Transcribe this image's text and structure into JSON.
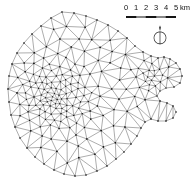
{
  "figure": {
    "background_color": "#ffffff",
    "line_color": "#3a3a3a",
    "node_color": "#111111",
    "width": 194,
    "height": 184
  },
  "map": {
    "type": "triangular-finite-element-mesh",
    "description": "Unstructured triangular mesh over an irregular island-shaped domain with locally refined (dense) zones",
    "domain_extent": {
      "x_min": 8,
      "x_max": 182,
      "y_min": 12,
      "y_max": 176
    }
  },
  "legend": {
    "scale_bar": {
      "unit": "km",
      "tick_labels": [
        "0",
        "1",
        "2",
        "3",
        "4",
        "5"
      ],
      "unit_label": "km",
      "min_value": 0,
      "max_value": 5,
      "bar_fill_colors": [
        "#1a1a1a",
        "#ffffff"
      ]
    },
    "north_arrow": {
      "label": "",
      "symbol": "north-arrow-circle"
    }
  },
  "chart_data": {
    "type": "scatter",
    "title": "",
    "xlabel": "",
    "ylabel": "",
    "grid": false,
    "legend_position": "top-right",
    "scale_km": {
      "ticks": [
        0,
        1,
        2,
        3,
        4,
        5
      ],
      "unit": "km"
    },
    "boundary_polygon": [
      [
        62,
        12
      ],
      [
        74,
        13
      ],
      [
        86,
        16
      ],
      [
        97,
        20
      ],
      [
        108,
        25
      ],
      [
        118,
        31
      ],
      [
        127,
        38
      ],
      [
        135,
        46
      ],
      [
        143,
        52
      ],
      [
        151,
        56
      ],
      [
        158,
        58
      ],
      [
        164,
        57
      ],
      [
        170,
        59
      ],
      [
        176,
        63
      ],
      [
        180,
        69
      ],
      [
        182,
        76
      ],
      [
        180,
        83
      ],
      [
        174,
        87
      ],
      [
        166,
        88
      ],
      [
        160,
        91
      ],
      [
        157,
        96
      ],
      [
        160,
        101
      ],
      [
        167,
        103
      ],
      [
        173,
        106
      ],
      [
        176,
        112
      ],
      [
        173,
        118
      ],
      [
        166,
        121
      ],
      [
        158,
        121
      ],
      [
        151,
        119
      ],
      [
        145,
        122
      ],
      [
        141,
        128
      ],
      [
        137,
        136
      ],
      [
        131,
        144
      ],
      [
        124,
        152
      ],
      [
        116,
        159
      ],
      [
        107,
        166
      ],
      [
        97,
        171
      ],
      [
        86,
        175
      ],
      [
        75,
        176
      ],
      [
        64,
        174
      ],
      [
        54,
        170
      ],
      [
        44,
        164
      ],
      [
        35,
        157
      ],
      [
        27,
        148
      ],
      [
        20,
        138
      ],
      [
        15,
        127
      ],
      [
        11,
        115
      ],
      [
        9,
        102
      ],
      [
        8,
        89
      ],
      [
        9,
        76
      ],
      [
        12,
        64
      ],
      [
        17,
        53
      ],
      [
        24,
        43
      ],
      [
        32,
        34
      ],
      [
        41,
        26
      ],
      [
        51,
        18
      ],
      [
        62,
        12
      ]
    ],
    "density_zones": [
      {
        "name": "coarse-top",
        "cx": 90,
        "cy": 40,
        "radius": 55,
        "spacing": 13
      },
      {
        "name": "dense-mid-left",
        "cx": 55,
        "cy": 95,
        "radius": 48,
        "spacing": 4
      },
      {
        "name": "dense-right-patch",
        "cx": 152,
        "cy": 78,
        "radius": 26,
        "spacing": 4.5
      },
      {
        "name": "coarse-bottom",
        "cx": 85,
        "cy": 150,
        "radius": 55,
        "spacing": 13
      }
    ]
  }
}
